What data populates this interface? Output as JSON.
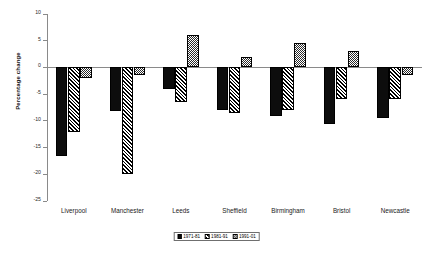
{
  "chart_data": {
    "type": "bar",
    "title": "",
    "xlabel": "",
    "ylabel": "Percentage change",
    "ylim": [
      -25,
      10
    ],
    "ytick_step": 5,
    "yticks": [
      10,
      5,
      0,
      -5,
      -10,
      -15,
      -20,
      -25
    ],
    "ytick_labels": [
      "10",
      "5",
      "0",
      "-5",
      "-10",
      "-15",
      "-20",
      "-25"
    ],
    "grid": false,
    "legend_position": "bottom",
    "categories": [
      "Liverpool",
      "Manchester",
      "Leeds",
      "Sheffield",
      "Birmingham",
      "Bristol",
      "Newcastle"
    ],
    "series": [
      {
        "name": "1971-81",
        "pattern": "solid-black",
        "values": [
          -16.5,
          -8.2,
          -4.0,
          -8.0,
          -9.0,
          -10.5,
          -9.5
        ]
      },
      {
        "name": "1981-91",
        "pattern": "diagonal-hatch",
        "values": [
          -12.0,
          -20.0,
          -6.5,
          -8.5,
          -8.0,
          -6.0,
          -6.0
        ]
      },
      {
        "name": "1991-01",
        "pattern": "checkered-light",
        "values": [
          -2.0,
          -1.5,
          6.0,
          2.0,
          4.5,
          3.0,
          -1.5
        ]
      }
    ]
  },
  "colors": {
    "series_1971_81": "#0d0d0d",
    "series_1981_91": "#000000",
    "series_1991_01": "#2a2a2a",
    "axis": "#8a8a8a",
    "background": "#ffffff"
  }
}
